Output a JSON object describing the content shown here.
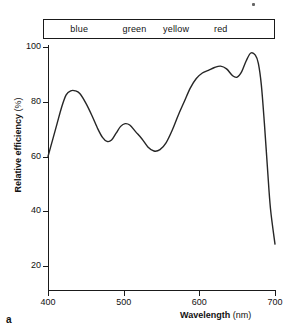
{
  "figure": {
    "panel_letter": "a",
    "color_band": {
      "labels": [
        "blue",
        "green",
        "yellow",
        "red"
      ],
      "label_centers_nm": [
        440,
        513,
        568,
        627
      ]
    }
  },
  "chart_data": {
    "type": "line",
    "title": "",
    "xlabel": "Wavelength",
    "xunit": "(nm)",
    "ylabel": "Relative efficiency",
    "yunit": "(%)",
    "xlim": [
      400,
      700
    ],
    "ylim": [
      14,
      104
    ],
    "grid": false,
    "legend": false,
    "xticks": [
      400,
      500,
      600,
      700
    ],
    "yticks": [
      20,
      40,
      60,
      80,
      100
    ],
    "series": [
      {
        "name": "Relative efficiency",
        "color": "#262626",
        "x": [
          400,
          406,
          412,
          418,
          424,
          430,
          436,
          442,
          450,
          458,
          466,
          472,
          478,
          484,
          490,
          496,
          502,
          508,
          516,
          524,
          532,
          540,
          548,
          556,
          564,
          572,
          580,
          588,
          596,
          604,
          612,
          620,
          628,
          636,
          644,
          650,
          656,
          662,
          668,
          674,
          678,
          682,
          686,
          690,
          694,
          700
        ],
        "y": [
          60,
          66,
          72,
          78,
          82.5,
          84,
          84,
          83,
          79.5,
          75,
          70,
          67,
          65.5,
          66,
          68.5,
          71,
          72,
          71.5,
          69,
          66.5,
          63.5,
          62,
          62.5,
          65,
          69.5,
          75,
          80,
          85,
          88.5,
          90.5,
          91.5,
          92.5,
          93,
          92,
          89.5,
          89,
          91,
          95,
          97.8,
          97,
          94,
          86,
          72,
          56,
          41,
          28
        ]
      }
    ]
  }
}
